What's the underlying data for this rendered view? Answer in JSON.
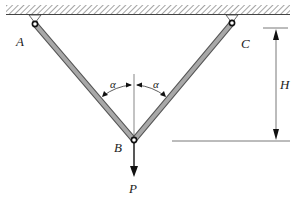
{
  "diagram": {
    "type": "two-bar truss with vertical load",
    "labels": {
      "A": "A",
      "B": "B",
      "C": "C",
      "H": "H",
      "P": "P",
      "alpha_left": "α",
      "alpha_right": "α"
    },
    "colors": {
      "bar_fill": "#a8a8a8",
      "bar_edge": "#555555",
      "line": "#333333",
      "text": "#222222",
      "hatch": "#666666"
    }
  }
}
